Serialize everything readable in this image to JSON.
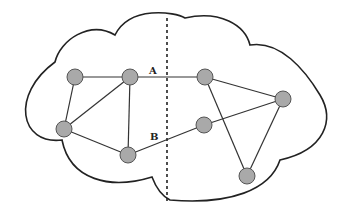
{
  "diagram": {
    "type": "network-partition",
    "cut_line": {
      "style": "dashed",
      "x": 167,
      "y1": 18,
      "y2": 202
    },
    "labels": {
      "A": {
        "text": "A",
        "x": 149,
        "y": 74
      },
      "B": {
        "text": "B",
        "x": 150,
        "y": 140
      }
    },
    "nodes": [
      {
        "id": "n1",
        "x": 75,
        "y": 77
      },
      {
        "id": "n2",
        "x": 130,
        "y": 77
      },
      {
        "id": "n3",
        "x": 64,
        "y": 129
      },
      {
        "id": "n4",
        "x": 128,
        "y": 155
      },
      {
        "id": "n5",
        "x": 205,
        "y": 77
      },
      {
        "id": "n6",
        "x": 283,
        "y": 99
      },
      {
        "id": "n7",
        "x": 204,
        "y": 125
      },
      {
        "id": "n8",
        "x": 247,
        "y": 176
      }
    ],
    "edges": [
      {
        "from": "n1",
        "to": "n2"
      },
      {
        "from": "n1",
        "to": "n3"
      },
      {
        "from": "n2",
        "to": "n3"
      },
      {
        "from": "n2",
        "to": "n4"
      },
      {
        "from": "n3",
        "to": "n4"
      },
      {
        "from": "n2",
        "to": "n5",
        "label": "A"
      },
      {
        "from": "n4",
        "to": "n7",
        "label": "B"
      },
      {
        "from": "n7",
        "to": "n6"
      },
      {
        "from": "n5",
        "to": "n6"
      },
      {
        "from": "n5",
        "to": "n8"
      },
      {
        "from": "n6",
        "to": "n8"
      }
    ],
    "colors": {
      "node_fill": "#a9a9a9",
      "node_stroke": "#555555",
      "line": "#333333",
      "cloud": "#222222"
    }
  }
}
